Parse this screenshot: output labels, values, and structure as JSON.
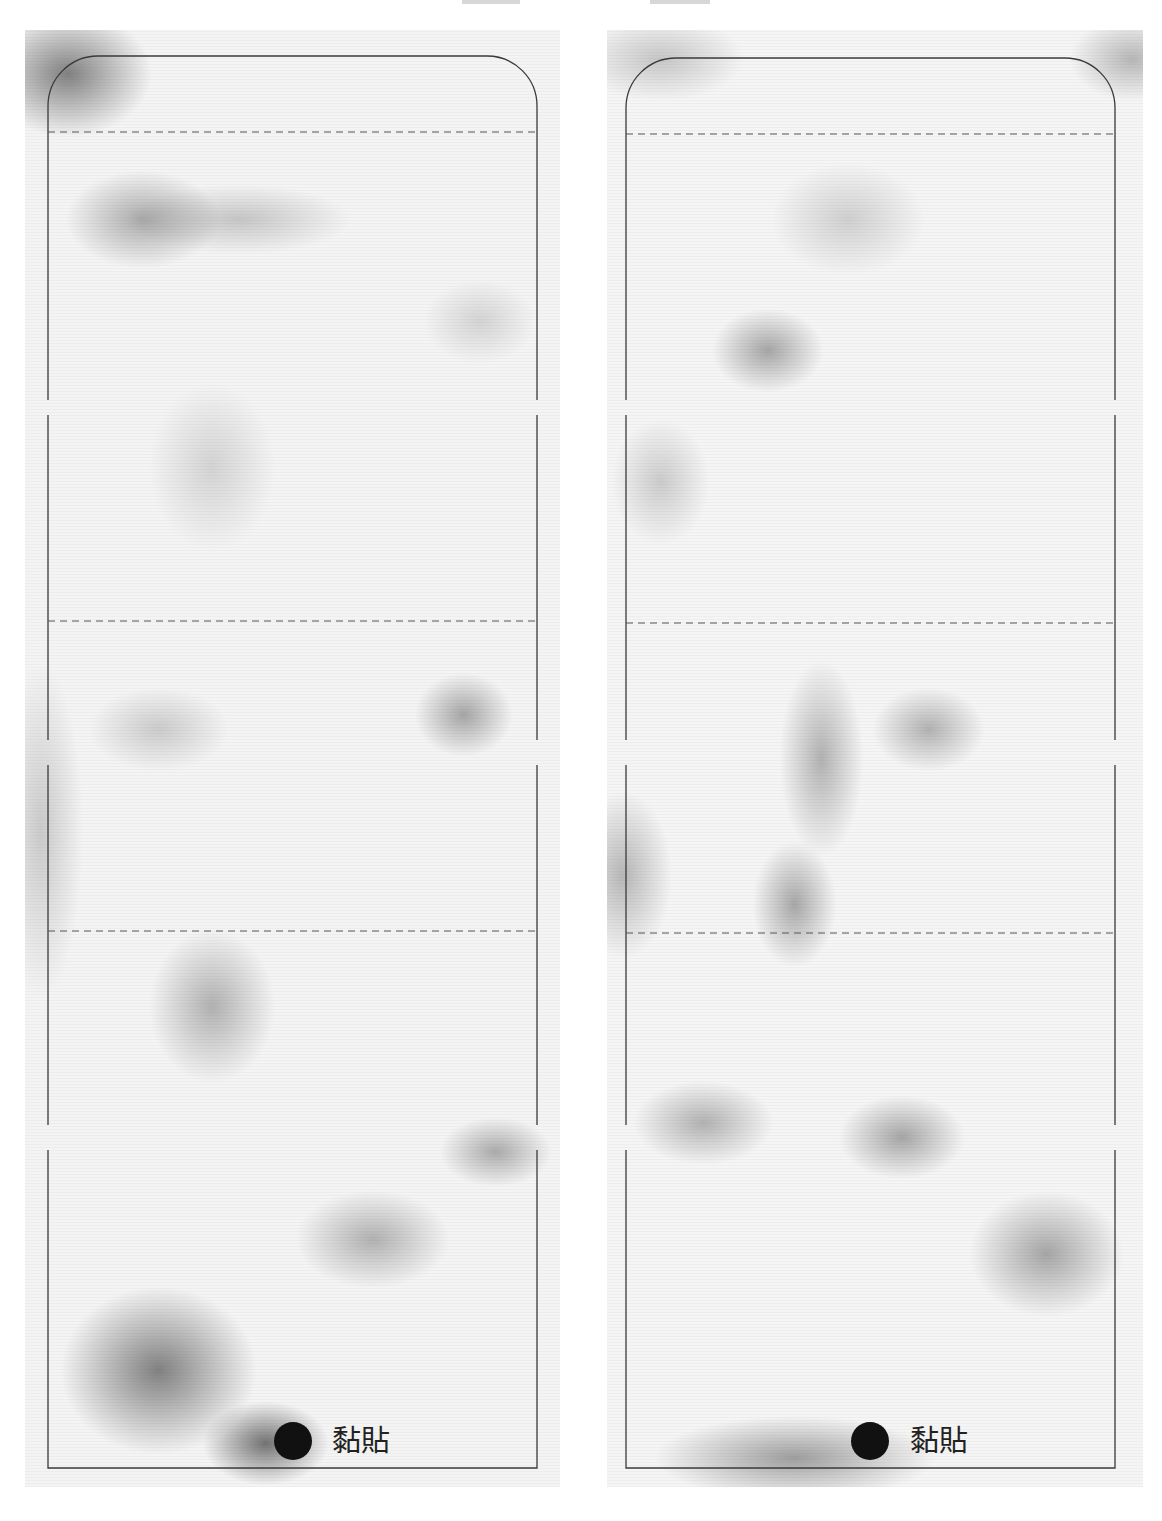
{
  "header": {
    "title_clipped": true
  },
  "colors": {
    "outline": "#3a3a3a",
    "dashed": "#555555",
    "dot": "#111111",
    "label": "#222222",
    "page_background": "#ffffff"
  },
  "panels": [
    {
      "id": "left",
      "paste_label": "黏貼",
      "paste_dot_icon": "filled-circle-icon",
      "fold_lines": 3,
      "texture": "gray-marble"
    },
    {
      "id": "right",
      "paste_label": "黏貼",
      "paste_dot_icon": "filled-circle-icon",
      "fold_lines": 3,
      "texture": "gray-marble"
    }
  ]
}
